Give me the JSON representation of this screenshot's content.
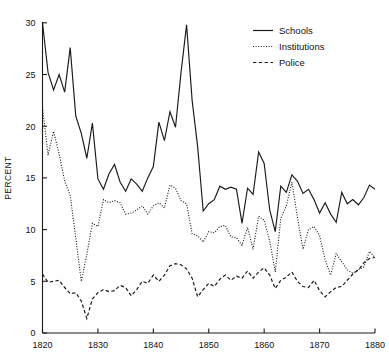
{
  "chart_data": {
    "type": "line",
    "title": "",
    "xlabel": "",
    "ylabel": "PERCENT",
    "xlim": [
      1820,
      1880
    ],
    "ylim": [
      0,
      30
    ],
    "xticks": [
      1820,
      1830,
      1840,
      1850,
      1860,
      1870,
      1880
    ],
    "xtick_labels": [
      "1820",
      "1830",
      "1840",
      "1850",
      "1860",
      "1870",
      "1880"
    ],
    "yticks": [
      0,
      5,
      10,
      15,
      20,
      25,
      30
    ],
    "ytick_labels": [
      "0",
      "5",
      "10",
      "15",
      "20",
      "25",
      "30"
    ],
    "grid": false,
    "legend_position": "top-right",
    "x": [
      1820,
      1821,
      1822,
      1823,
      1824,
      1825,
      1826,
      1827,
      1828,
      1829,
      1830,
      1831,
      1832,
      1833,
      1834,
      1835,
      1836,
      1837,
      1838,
      1839,
      1840,
      1841,
      1842,
      1843,
      1844,
      1845,
      1846,
      1847,
      1848,
      1849,
      1850,
      1851,
      1852,
      1853,
      1854,
      1855,
      1856,
      1857,
      1858,
      1859,
      1860,
      1861,
      1862,
      1863,
      1864,
      1865,
      1866,
      1867,
      1868,
      1869,
      1870,
      1871,
      1872,
      1873,
      1874,
      1875,
      1876,
      1877,
      1878,
      1879,
      1880
    ],
    "series": [
      {
        "name": "Schools",
        "style": "solid",
        "color": "#1a1a1a",
        "values": [
          30.0,
          25.2,
          23.5,
          25.0,
          23.3,
          27.6,
          21.0,
          19.3,
          16.9,
          20.3,
          14.9,
          13.9,
          15.4,
          16.3,
          14.6,
          13.7,
          14.9,
          14.4,
          13.7,
          15.0,
          16.1,
          20.4,
          18.6,
          21.4,
          19.9,
          25.2,
          29.8,
          22.5,
          18.0,
          11.8,
          12.5,
          12.9,
          14.2,
          13.9,
          14.1,
          13.9,
          10.6,
          14.0,
          13.4,
          17.5,
          16.4,
          11.9,
          9.8,
          14.2,
          13.6,
          15.3,
          14.7,
          13.5,
          13.9,
          12.9,
          11.6,
          12.6,
          11.5,
          10.7,
          13.6,
          12.5,
          12.9,
          12.4,
          13.1,
          14.3,
          13.9
        ]
      },
      {
        "name": "Institutions",
        "style": "dotted",
        "color": "#1a1a1a",
        "values": [
          21.8,
          17.2,
          19.5,
          17.3,
          14.7,
          13.3,
          9.2,
          5.0,
          7.6,
          10.6,
          10.3,
          12.9,
          12.6,
          12.8,
          12.6,
          11.5,
          11.6,
          11.9,
          12.3,
          11.5,
          12.3,
          12.6,
          12.1,
          14.3,
          14.0,
          12.8,
          12.5,
          9.6,
          9.4,
          8.8,
          9.8,
          9.7,
          10.3,
          10.4,
          9.3,
          9.2,
          8.5,
          10.2,
          8.1,
          11.3,
          10.9,
          8.9,
          5.9,
          11.1,
          12.3,
          14.6,
          11.2,
          8.1,
          10.0,
          10.3,
          9.4,
          7.1,
          5.6,
          7.7,
          6.9,
          6.1,
          5.8,
          6.1,
          6.4,
          7.9,
          7.3
        ]
      },
      {
        "name": "Police",
        "style": "dashed",
        "color": "#1a1a1a",
        "values": [
          5.7,
          4.9,
          5.0,
          5.1,
          4.4,
          3.8,
          3.9,
          3.1,
          1.4,
          3.3,
          3.9,
          4.2,
          4.0,
          4.1,
          4.6,
          4.4,
          3.6,
          4.2,
          5.0,
          4.8,
          5.6,
          5.0,
          5.6,
          6.5,
          6.7,
          6.6,
          6.2,
          5.3,
          3.5,
          4.2,
          4.8,
          4.5,
          5.2,
          5.6,
          5.1,
          5.5,
          5.3,
          6.0,
          5.3,
          5.9,
          6.3,
          5.6,
          4.3,
          5.1,
          5.4,
          5.9,
          5.0,
          4.5,
          4.4,
          5.1,
          4.1,
          3.5,
          4.0,
          4.4,
          4.5,
          5.1,
          5.7,
          6.1,
          6.8,
          7.2,
          7.3
        ]
      }
    ]
  },
  "legend": {
    "items": [
      {
        "label": "Schools",
        "style": "solid"
      },
      {
        "label": "Institutions",
        "style": "dotted"
      },
      {
        "label": "Police",
        "style": "dashed"
      }
    ]
  },
  "axis": {
    "y_title": "PERCENT"
  }
}
